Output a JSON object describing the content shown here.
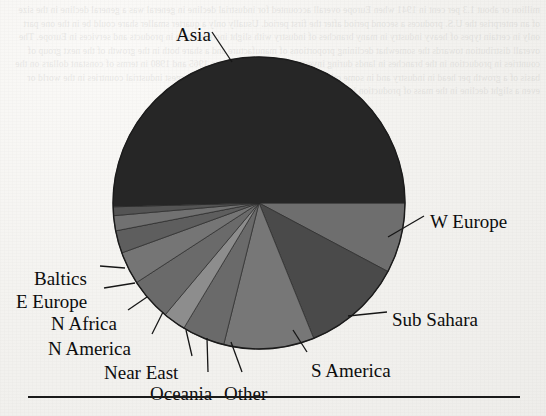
{
  "document": {
    "type": "scanned-page-figure",
    "background_color": "#f2f1ee",
    "ghost_text": "million or about 1.3 per cent in 1941 when Europe overall accounted for industrial decline in general was a general decline in the size of an enterprise the U.S. produces a second period after the first period. Usually only a quarter smaller share could be in the one part only in certain types of heavy industry in many branches of industry with slight increase both in products and services in Europe. The overall distribution towards the somewhat declining proportions of manufacture and a share both in the growth of the next group of countries in production in the branches in lands during investment trends in between 1965 and 1980 in terms of constant dollars on the basis of a growth per head in industry and in some other countries including 1975 for the largest industrial countries in the world or even a slight decline in the mass of production in the growth in each of the branches of industry."
  },
  "figure": {
    "title": "",
    "horizontal_rule": true,
    "pie": {
      "center_x": 259,
      "center_y": 203,
      "radius": 146,
      "outline_color": "#1b1b1b",
      "leader_line_color": "#161616"
    }
  },
  "chart_data": {
    "type": "pie",
    "title": "",
    "xlabel": "",
    "ylabel": "",
    "legend": "none",
    "labels_position": "outside-with-leader-lines",
    "start_angle_deg": 0,
    "direction": "clockwise",
    "categories": [
      "W Europe",
      "Sub Sahara",
      "S America",
      "Other",
      "Oceania",
      "Near East",
      "N America",
      "N Africa",
      "E Europe",
      "Baltics",
      "Asia"
    ],
    "values": [
      7.8,
      11.1,
      10.0,
      4.7,
      2.5,
      4.7,
      3.6,
      2.5,
      1.7,
      0.9,
      50.5
    ],
    "unit": "percent",
    "slices": [
      {
        "label": "W Europe",
        "value": 7.8,
        "color": "#6e6e6e",
        "start_deg": 0.0,
        "end_deg": 28.0,
        "label_x": 430,
        "label_y": 212,
        "leader_from_x": 388,
        "leader_from_y": 237,
        "leader_to_x": 424,
        "leader_to_y": 216
      },
      {
        "label": "Sub Sahara",
        "value": 11.1,
        "color": "#4a4a4a",
        "start_deg": 28.0,
        "end_deg": 68.0,
        "label_x": 392,
        "label_y": 310,
        "leader_from_x": 348,
        "leader_from_y": 316,
        "leader_to_x": 387,
        "leader_to_y": 312
      },
      {
        "label": "S America",
        "value": 10.0,
        "color": "#777777",
        "start_deg": 68.0,
        "end_deg": 104.0,
        "label_x": 311,
        "label_y": 361,
        "leader_from_x": 293,
        "leader_from_y": 330,
        "leader_to_x": 307,
        "leader_to_y": 352
      },
      {
        "label": "Other",
        "value": 4.7,
        "color": "#6a6a6a",
        "start_deg": 104.0,
        "end_deg": 121.0,
        "label_x": 224,
        "label_y": 384,
        "leader_from_x": 231,
        "leader_from_y": 342,
        "leader_to_x": 242,
        "leader_to_y": 372
      },
      {
        "label": "Oceania",
        "value": 2.5,
        "color": "#8d8d8d",
        "start_deg": 121.0,
        "end_deg": 130.0,
        "label_x": 150,
        "label_y": 384,
        "leader_from_x": 207,
        "leader_from_y": 338,
        "leader_to_x": 208,
        "leader_to_y": 372
      },
      {
        "label": "Near East",
        "value": 4.7,
        "color": "#6a6a6a",
        "start_deg": 130.0,
        "end_deg": 147.0,
        "label_x": 104,
        "label_y": 363,
        "leader_from_x": 186,
        "leader_from_y": 330,
        "leader_to_x": 192,
        "leader_to_y": 356
      },
      {
        "label": "N America",
        "value": 3.6,
        "color": "#757575",
        "start_deg": 147.0,
        "end_deg": 160.0,
        "label_x": 48,
        "label_y": 339,
        "leader_from_x": 163,
        "leader_from_y": 312,
        "leader_to_x": 152,
        "leader_to_y": 334
      },
      {
        "label": "N Africa",
        "value": 2.5,
        "color": "#5e5e5e",
        "start_deg": 160.0,
        "end_deg": 169.0,
        "label_x": 51,
        "label_y": 314,
        "leader_from_x": 147,
        "leader_from_y": 297,
        "leader_to_x": 128,
        "leader_to_y": 310
      },
      {
        "label": "E Europe",
        "value": 1.7,
        "color": "#717171",
        "start_deg": 169.0,
        "end_deg": 175.0,
        "label_x": 16,
        "label_y": 292,
        "leader_from_x": 135,
        "leader_from_y": 283,
        "leader_to_x": 104,
        "leader_to_y": 288
      },
      {
        "label": "Baltics",
        "value": 0.9,
        "color": "#545454",
        "start_deg": 175.0,
        "end_deg": 178.5,
        "label_x": 34,
        "label_y": 269,
        "leader_from_x": 125,
        "leader_from_y": 268,
        "leader_to_x": 100,
        "leader_to_y": 266
      },
      {
        "label": "Asia",
        "value": 50.5,
        "color": "#262626",
        "start_deg": 178.5,
        "end_deg": 360.0,
        "label_x": 176,
        "label_y": 25,
        "leader_from_x": 232,
        "leader_from_y": 62,
        "leader_to_x": 212,
        "leader_to_y": 32
      }
    ]
  }
}
